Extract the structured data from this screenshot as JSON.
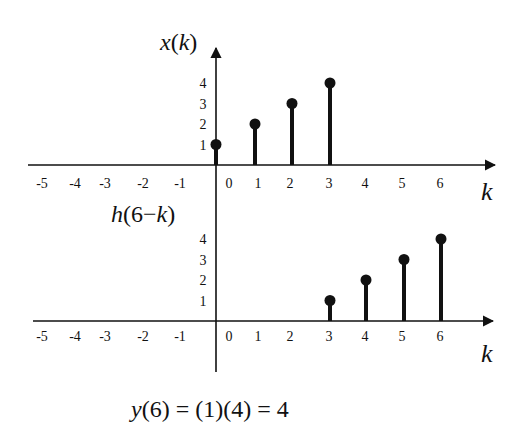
{
  "chart_data": [
    {
      "type": "stem",
      "title": "x(k)",
      "xlabel": "k",
      "ylabel": "",
      "x_ticks": [
        -5,
        -4,
        -3,
        -2,
        -1,
        0,
        1,
        2,
        3,
        4,
        5,
        6
      ],
      "y_ticks": [
        1,
        2,
        3,
        4
      ],
      "x": [
        0,
        1,
        2,
        3
      ],
      "values": [
        1,
        2,
        3,
        4
      ],
      "xlim": [
        -5,
        6
      ],
      "ylim": [
        0,
        4
      ],
      "grid": false
    },
    {
      "type": "stem",
      "title": "h(6 − k)",
      "xlabel": "k",
      "ylabel": "",
      "x_ticks": [
        -5,
        -4,
        -3,
        -2,
        -1,
        0,
        1,
        2,
        3,
        4,
        5,
        6
      ],
      "y_ticks": [
        1,
        2,
        3,
        4
      ],
      "x": [
        3,
        4,
        5,
        6
      ],
      "values": [
        1,
        2,
        3,
        4
      ],
      "xlim": [
        -5,
        6
      ],
      "ylim": [
        0,
        4
      ],
      "grid": false
    }
  ],
  "top_plot": {
    "title_fn": "x",
    "title_arg": "k",
    "xlabel": "k",
    "x_tick_labels": [
      "-5",
      "-4",
      "-3",
      "-2",
      "-1",
      "0",
      "1",
      "2",
      "3",
      "4",
      "5",
      "6"
    ],
    "y_tick_labels": [
      "1",
      "2",
      "3",
      "4"
    ]
  },
  "bottom_plot": {
    "title_fn": "h",
    "title_arg_num": "6",
    "title_minus": "−",
    "title_arg_var": "k",
    "xlabel": "k",
    "x_tick_labels": [
      "-5",
      "-4",
      "-3",
      "-2",
      "-1",
      "0",
      "1",
      "2",
      "3",
      "4",
      "5",
      "6"
    ],
    "y_tick_labels": [
      "1",
      "2",
      "3",
      "4"
    ]
  },
  "equation": {
    "fn": "y",
    "rest": "(6) = (1)(4) = 4"
  },
  "colors": {
    "ink": "#111111",
    "background": "#ffffff"
  }
}
